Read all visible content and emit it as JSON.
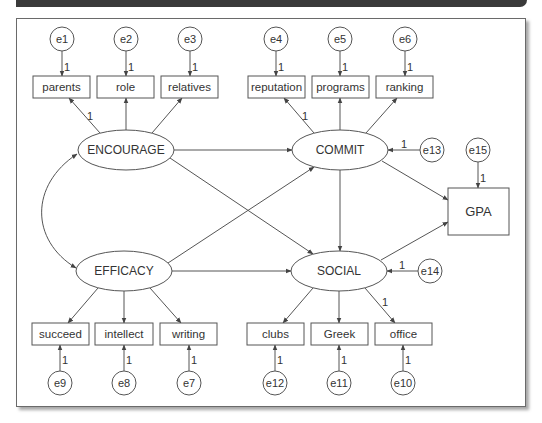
{
  "diagram": {
    "type": "structural-equation-model",
    "colors": {
      "stroke": "#555555",
      "text": "#333333",
      "topbar": "#3a3a3a",
      "frame": "#6a6a6a"
    },
    "latent": [
      {
        "id": "ENCOURAGE",
        "label": "ENCOURAGE",
        "cx": 126,
        "cy": 150,
        "rx": 48,
        "ry": 20
      },
      {
        "id": "COMMIT",
        "label": "COMMIT",
        "cx": 340,
        "cy": 150,
        "rx": 48,
        "ry": 20
      },
      {
        "id": "EFFICACY",
        "label": "EFFICACY",
        "cx": 124,
        "cy": 271,
        "rx": 48,
        "ry": 20
      },
      {
        "id": "SOCIAL",
        "label": "SOCIAL",
        "cx": 339,
        "cy": 271,
        "rx": 48,
        "ry": 20
      }
    ],
    "observed": [
      {
        "id": "parents",
        "label": "parents",
        "x": 33,
        "y": 76,
        "w": 57,
        "h": 22
      },
      {
        "id": "role",
        "label": "role",
        "x": 97,
        "y": 76,
        "w": 57,
        "h": 22
      },
      {
        "id": "relatives",
        "label": "relatives",
        "x": 161,
        "y": 76,
        "w": 57,
        "h": 22
      },
      {
        "id": "reputation",
        "label": "reputation",
        "x": 248,
        "y": 76,
        "w": 57,
        "h": 22
      },
      {
        "id": "programs",
        "label": "programs",
        "x": 312,
        "y": 76,
        "w": 57,
        "h": 22
      },
      {
        "id": "ranking",
        "label": "ranking",
        "x": 376,
        "y": 76,
        "w": 57,
        "h": 22
      },
      {
        "id": "succeed",
        "label": "succeed",
        "x": 32,
        "y": 323,
        "w": 57,
        "h": 22
      },
      {
        "id": "intellect",
        "label": "intellect",
        "x": 95,
        "y": 323,
        "w": 58,
        "h": 22
      },
      {
        "id": "writing",
        "label": "writing",
        "x": 160,
        "y": 323,
        "w": 57,
        "h": 22
      },
      {
        "id": "clubs",
        "label": "clubs",
        "x": 247,
        "y": 323,
        "w": 57,
        "h": 22
      },
      {
        "id": "Greek",
        "label": "Greek",
        "x": 311,
        "y": 323,
        "w": 57,
        "h": 22
      },
      {
        "id": "office",
        "label": "office",
        "x": 375,
        "y": 323,
        "w": 57,
        "h": 22
      },
      {
        "id": "GPA",
        "label": "GPA",
        "x": 448,
        "y": 188,
        "w": 61,
        "h": 47
      }
    ],
    "errors": [
      {
        "id": "e1",
        "label": "e1",
        "cx": 62,
        "cy": 39,
        "r": 12
      },
      {
        "id": "e2",
        "label": "e2",
        "cx": 126,
        "cy": 39,
        "r": 12
      },
      {
        "id": "e3",
        "label": "e3",
        "cx": 190,
        "cy": 39,
        "r": 12
      },
      {
        "id": "e4",
        "label": "e4",
        "cx": 276,
        "cy": 39,
        "r": 12
      },
      {
        "id": "e5",
        "label": "e5",
        "cx": 340,
        "cy": 39,
        "r": 12
      },
      {
        "id": "e6",
        "label": "e6",
        "cx": 405,
        "cy": 39,
        "r": 12
      },
      {
        "id": "e9",
        "label": "e9",
        "cx": 60,
        "cy": 383,
        "r": 12
      },
      {
        "id": "e8",
        "label": "e8",
        "cx": 124,
        "cy": 383,
        "r": 12
      },
      {
        "id": "e7",
        "label": "e7",
        "cx": 189,
        "cy": 383,
        "r": 12
      },
      {
        "id": "e12",
        "label": "e12",
        "cx": 275,
        "cy": 383,
        "r": 12
      },
      {
        "id": "e11",
        "label": "e11",
        "cx": 339,
        "cy": 383,
        "r": 12
      },
      {
        "id": "e10",
        "label": "e10",
        "cx": 403,
        "cy": 383,
        "r": 12
      },
      {
        "id": "e13",
        "label": "e13",
        "cx": 432,
        "cy": 150,
        "r": 12
      },
      {
        "id": "e14",
        "label": "e14",
        "cx": 430,
        "cy": 271,
        "r": 12
      },
      {
        "id": "e15",
        "label": "e15",
        "cx": 478,
        "cy": 150,
        "r": 12
      }
    ],
    "paths": [
      {
        "from": "e1",
        "to": "parents",
        "x1": 62,
        "y1": 51,
        "x2": 62,
        "y2": 76,
        "label": "1",
        "lx": 67,
        "ly": 67
      },
      {
        "from": "e2",
        "to": "role",
        "x1": 126,
        "y1": 51,
        "x2": 126,
        "y2": 76,
        "label": "1",
        "lx": 131,
        "ly": 67
      },
      {
        "from": "e3",
        "to": "relatives",
        "x1": 190,
        "y1": 51,
        "x2": 190,
        "y2": 76,
        "label": "1",
        "lx": 195,
        "ly": 67
      },
      {
        "from": "e4",
        "to": "reputation",
        "x1": 276,
        "y1": 51,
        "x2": 276,
        "y2": 76,
        "label": "1",
        "lx": 281,
        "ly": 67
      },
      {
        "from": "e5",
        "to": "programs",
        "x1": 340,
        "y1": 51,
        "x2": 340,
        "y2": 76,
        "label": "1",
        "lx": 345,
        "ly": 67
      },
      {
        "from": "e6",
        "to": "ranking",
        "x1": 405,
        "y1": 51,
        "x2": 405,
        "y2": 76,
        "label": "1",
        "lx": 410,
        "ly": 67
      },
      {
        "from": "ENCOURAGE",
        "to": "parents",
        "x1": 100,
        "y1": 133,
        "x2": 69,
        "y2": 98,
        "label": "1",
        "lx": 90,
        "ly": 116
      },
      {
        "from": "ENCOURAGE",
        "to": "role",
        "x1": 126,
        "y1": 130,
        "x2": 126,
        "y2": 98,
        "label": "",
        "lx": 0,
        "ly": 0
      },
      {
        "from": "ENCOURAGE",
        "to": "relatives",
        "x1": 152,
        "y1": 133,
        "x2": 182,
        "y2": 98,
        "label": "",
        "lx": 0,
        "ly": 0
      },
      {
        "from": "COMMIT",
        "to": "reputation",
        "x1": 314,
        "y1": 133,
        "x2": 284,
        "y2": 98,
        "label": "1",
        "lx": 305,
        "ly": 116
      },
      {
        "from": "COMMIT",
        "to": "programs",
        "x1": 340,
        "y1": 130,
        "x2": 340,
        "y2": 98,
        "label": "",
        "lx": 0,
        "ly": 0
      },
      {
        "from": "COMMIT",
        "to": "ranking",
        "x1": 366,
        "y1": 133,
        "x2": 397,
        "y2": 98,
        "label": "",
        "lx": 0,
        "ly": 0
      },
      {
        "from": "ENCOURAGE",
        "to": "COMMIT",
        "x1": 174,
        "y1": 150,
        "x2": 292,
        "y2": 150,
        "label": "",
        "lx": 0,
        "ly": 0
      },
      {
        "from": "ENCOURAGE",
        "to": "SOCIAL",
        "x1": 170,
        "y1": 158,
        "x2": 313,
        "y2": 254,
        "label": "",
        "lx": 0,
        "ly": 0
      },
      {
        "from": "EFFICACY",
        "to": "COMMIT",
        "x1": 168,
        "y1": 263,
        "x2": 314,
        "y2": 167,
        "label": "",
        "lx": 0,
        "ly": 0
      },
      {
        "from": "EFFICACY",
        "to": "SOCIAL",
        "x1": 172,
        "y1": 271,
        "x2": 291,
        "y2": 271,
        "label": "",
        "lx": 0,
        "ly": 0
      },
      {
        "from": "COMMIT",
        "to": "SOCIAL",
        "x1": 340,
        "y1": 170,
        "x2": 340,
        "y2": 251,
        "label": "",
        "lx": 0,
        "ly": 0
      },
      {
        "from": "COMMIT",
        "to": "GPA",
        "x1": 382,
        "y1": 161,
        "x2": 448,
        "y2": 200,
        "label": "",
        "lx": 0,
        "ly": 0
      },
      {
        "from": "SOCIAL",
        "to": "GPA",
        "x1": 381,
        "y1": 260,
        "x2": 448,
        "y2": 222,
        "label": "",
        "lx": 0,
        "ly": 0
      },
      {
        "from": "e13",
        "to": "COMMIT",
        "x1": 420,
        "y1": 150,
        "x2": 388,
        "y2": 150,
        "label": "1",
        "lx": 404,
        "ly": 144
      },
      {
        "from": "e14",
        "to": "SOCIAL",
        "x1": 418,
        "y1": 271,
        "x2": 387,
        "y2": 271,
        "label": "1",
        "lx": 402,
        "ly": 265
      },
      {
        "from": "e15",
        "to": "GPA",
        "x1": 478,
        "y1": 162,
        "x2": 478,
        "y2": 188,
        "label": "1",
        "lx": 483,
        "ly": 178
      },
      {
        "from": "EFFICACY",
        "to": "succeed",
        "x1": 98,
        "y1": 288,
        "x2": 68,
        "y2": 323,
        "label": "",
        "lx": 0,
        "ly": 0
      },
      {
        "from": "EFFICACY",
        "to": "intellect",
        "x1": 124,
        "y1": 291,
        "x2": 124,
        "y2": 323,
        "label": "",
        "lx": 0,
        "ly": 0
      },
      {
        "from": "EFFICACY",
        "to": "writing",
        "x1": 150,
        "y1": 288,
        "x2": 181,
        "y2": 323,
        "label": "",
        "lx": 0,
        "ly": 0
      },
      {
        "from": "SOCIAL",
        "to": "clubs",
        "x1": 313,
        "y1": 288,
        "x2": 283,
        "y2": 323,
        "label": "",
        "lx": 0,
        "ly": 0
      },
      {
        "from": "SOCIAL",
        "to": "Greek",
        "x1": 339,
        "y1": 291,
        "x2": 339,
        "y2": 323,
        "label": "",
        "lx": 0,
        "ly": 0
      },
      {
        "from": "SOCIAL",
        "to": "office",
        "x1": 365,
        "y1": 288,
        "x2": 395,
        "y2": 323,
        "label": "1",
        "lx": 385,
        "ly": 302
      },
      {
        "from": "e9",
        "to": "succeed",
        "x1": 60,
        "y1": 371,
        "x2": 60,
        "y2": 345,
        "label": "1",
        "lx": 65,
        "ly": 360
      },
      {
        "from": "e8",
        "to": "intellect",
        "x1": 124,
        "y1": 371,
        "x2": 124,
        "y2": 345,
        "label": "1",
        "lx": 129,
        "ly": 360
      },
      {
        "from": "e7",
        "to": "writing",
        "x1": 189,
        "y1": 371,
        "x2": 189,
        "y2": 345,
        "label": "1",
        "lx": 194,
        "ly": 360
      },
      {
        "from": "e12",
        "to": "clubs",
        "x1": 275,
        "y1": 371,
        "x2": 275,
        "y2": 345,
        "label": "1",
        "lx": 280,
        "ly": 360
      },
      {
        "from": "e11",
        "to": "Greek",
        "x1": 339,
        "y1": 371,
        "x2": 339,
        "y2": 345,
        "label": "1",
        "lx": 344,
        "ly": 360
      },
      {
        "from": "e10",
        "to": "office",
        "x1": 403,
        "y1": 371,
        "x2": 403,
        "y2": 345,
        "label": "1",
        "lx": 408,
        "ly": 360
      }
    ],
    "covariances": [
      {
        "from": "ENCOURAGE",
        "to": "EFFICACY",
        "d": "M 77 154 C 30 185, 30 240, 76 268"
      }
    ]
  }
}
